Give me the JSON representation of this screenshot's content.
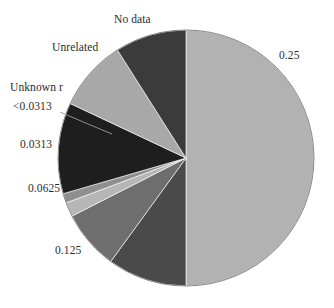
{
  "figure": {
    "background_color": "#ffffff",
    "label_color": "#2b2b2b"
  },
  "chart_data": {
    "type": "pie",
    "title": "",
    "subtitle": "",
    "xlabel": "",
    "ylabel": "",
    "grid": false,
    "legend_position": "none",
    "label_placement": "outside-perimeter",
    "start_angle_deg": 90,
    "direction": "clockwise",
    "center": {
      "x": 186,
      "y": 158
    },
    "radius": 128,
    "labels": [
      "0.25",
      "0.125",
      "0.0625",
      "0.0313",
      "<0.0313",
      "Unknown r",
      "Unrelated",
      "No data"
    ],
    "values": [
      0.5,
      0.1,
      0.075,
      0.018,
      0.012,
      0.115,
      0.09,
      0.09
    ],
    "colors": [
      "#b2b2b2",
      "#4a4a4a",
      "#6e6e6e",
      "#b6b6b6",
      "#8f8f8f",
      "#1e1e1e",
      "#a8a8a8",
      "#3b3b3b"
    ],
    "slices": [
      {
        "label": "0.25",
        "value": 0.5,
        "color": "#b2b2b2",
        "label_pos": "right",
        "leader": false
      },
      {
        "label": "0.125",
        "value": 0.1,
        "color": "#4a4a4a",
        "label_pos": "lower-left",
        "leader": false
      },
      {
        "label": "0.0625",
        "value": 0.075,
        "color": "#6e6e6e",
        "label_pos": "left",
        "leader": false
      },
      {
        "label": "0.0313",
        "value": 0.018,
        "color": "#b6b6b6",
        "label_pos": "left",
        "leader": false
      },
      {
        "label": "<0.0313",
        "value": 0.012,
        "color": "#8f8f8f",
        "label_pos": "upper-left",
        "leader": true
      },
      {
        "label": "Unknown r",
        "value": 0.115,
        "color": "#1e1e1e",
        "label_pos": "upper-left",
        "leader": false
      },
      {
        "label": "Unrelated",
        "value": 0.09,
        "color": "#a8a8a8",
        "label_pos": "upper-left",
        "leader": false
      },
      {
        "label": "No data",
        "value": 0.09,
        "color": "#3b3b3b",
        "label_pos": "top",
        "leader": false
      }
    ]
  },
  "labels": {
    "no_data": "No data",
    "unrelated": "Unrelated",
    "unknown_r": "Unknown r",
    "lt_0313": "<0.0313",
    "v_0313": "0.0313",
    "v_0625": "0.0625",
    "v_125": "0.125",
    "v_25": "0.25"
  }
}
